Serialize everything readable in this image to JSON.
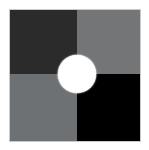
{
  "figure": {
    "canvas_width": 149,
    "canvas_height": 150,
    "background_color": "#ffffff",
    "plate": {
      "border_color": "#c9c9c9",
      "left": 9,
      "top": 9,
      "width": 132,
      "height": 133,
      "split_x": 67,
      "split_y": 64
    },
    "quadrants": [
      {
        "name": "top-left",
        "label": "Top-left quadrant",
        "color": "#2b2b2b",
        "tone": "very dark gray"
      },
      {
        "name": "top-right",
        "label": "Top-right quadrant",
        "color": "#737577",
        "tone": "medium gray"
      },
      {
        "name": "bottom-left",
        "label": "Bottom-left quadrant",
        "color": "#6e7173",
        "tone": "medium gray"
      },
      {
        "name": "bottom-right",
        "label": "Bottom-right quadrant",
        "color": "#000000",
        "tone": "black"
      }
    ],
    "disc": {
      "name": "center-disc",
      "label": "Central white disc",
      "color": "#ffffff",
      "center_x": 76,
      "center_y": 74,
      "diameter": 38
    }
  }
}
